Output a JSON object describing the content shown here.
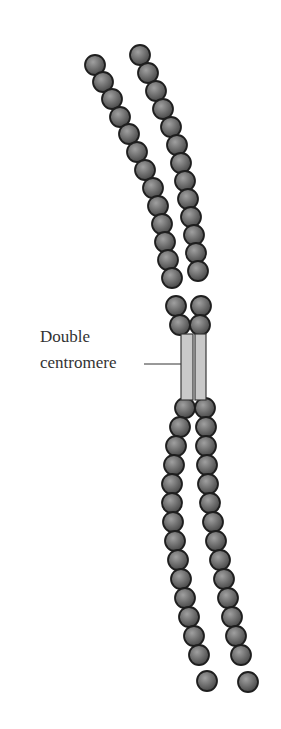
{
  "diagram": {
    "type": "chromosome",
    "label": {
      "line1": "Double",
      "line2": "centromere"
    },
    "structure": {
      "chromatids": 2,
      "centromeres": 2,
      "beads_per_upper_arm": 15,
      "beads_per_lower_arm": 15
    },
    "colors": {
      "bead_fill": "#6e6e6e",
      "bead_highlight": "#9a9a9a",
      "bead_stroke": "#1e1e1e",
      "centromere_fill": "#c9c9c9",
      "centromere_stroke": "#3a3a3a",
      "leader_line": "#333333"
    }
  }
}
